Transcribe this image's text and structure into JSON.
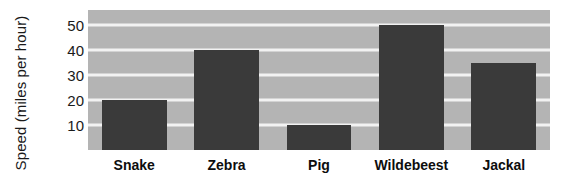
{
  "chart_data": {
    "type": "bar",
    "title": "",
    "subtitle": "",
    "xlabel": "",
    "ylabel": "Speed (miles per hour)",
    "categories": [
      "Snake",
      "Zebra",
      "Pig",
      "Wildebeest",
      "Jackal"
    ],
    "values": [
      20,
      40,
      10,
      50,
      35
    ],
    "series": [
      {
        "name": "Speed",
        "values": [
          20,
          40,
          10,
          50,
          35
        ]
      }
    ],
    "ylim": [
      0,
      56
    ],
    "yticks": [
      10,
      20,
      30,
      40,
      50
    ],
    "ytick_labels": [
      "10",
      "20",
      "30",
      "40",
      "50"
    ],
    "xtick_labels": [
      "Snake",
      "Zebra",
      "Pig",
      "Wildebeest",
      "Jackal"
    ],
    "grid": true,
    "grid_axis": "y",
    "grid_color": "#f2f2f2",
    "legend": false,
    "legend_position": "none",
    "bar_color": "#3a3a3a",
    "plot_background": "#b4b4b4",
    "figure_background": "#ffffff",
    "annotations": []
  }
}
